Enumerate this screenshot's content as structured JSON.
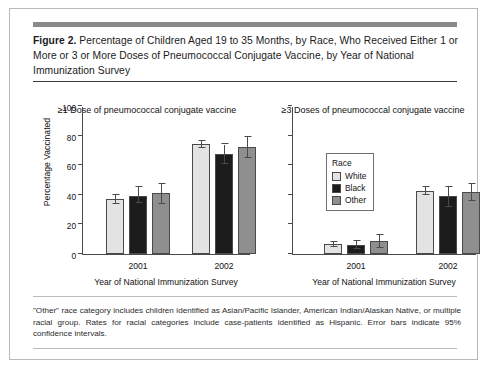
{
  "figure": {
    "label": "Figure 2.",
    "caption": " Percentage of Children Aged 19 to 35 Months, by Race, Who Received Either 1 or More or 3 or More Doses of Pneumococcal Conjugate Vaccine, by Year of National Immunization Survey",
    "footnote": "\"Other\" race category includes children identified as Asian/Pacific Islander, American Indian/Alaskan Native, or multiple racial group. Rates for racial categories include case-patients identified as Hispanic. Error bars indicate 95% confidence intervals."
  },
  "legend": {
    "title": "Race",
    "entries": [
      {
        "label": "White",
        "color": "#e3e3e3"
      },
      {
        "label": "Black",
        "color": "#1c1c1c"
      },
      {
        "label": "Other",
        "color": "#8f8f8f"
      }
    ]
  },
  "axis": {
    "ylabel": "Percentage Vaccinated",
    "xlabel": "Year of National Immunization Survey",
    "yticks": [
      "0",
      "20",
      "40",
      "60",
      "80",
      "100"
    ],
    "xticks": [
      "2001",
      "2002"
    ]
  },
  "chart_data": [
    {
      "type": "bar",
      "title": "≥1 Dose of pneumococcal conjugate vaccine",
      "xlabel": "Year of National Immunization Survey",
      "ylabel": "Percentage Vaccinated",
      "ylim": [
        0,
        100
      ],
      "ytick_values": [
        0,
        20,
        40,
        60,
        80,
        100
      ],
      "grid": false,
      "legend_position": "none",
      "categories": [
        "2001",
        "2002"
      ],
      "series": [
        {
          "name": "White",
          "color": "#e3e3e3",
          "values": [
            37.0,
            74.0
          ],
          "ci_low": [
            34.0,
            71.5
          ],
          "ci_high": [
            40.0,
            76.5
          ]
        },
        {
          "name": "Black",
          "color": "#1c1c1c",
          "values": [
            39.5,
            67.5
          ],
          "ci_low": [
            34.5,
            61.0
          ],
          "ci_high": [
            45.0,
            74.0
          ]
        },
        {
          "name": "Other",
          "color": "#8f8f8f",
          "values": [
            41.0,
            72.0
          ],
          "ci_low": [
            34.0,
            65.0
          ],
          "ci_high": [
            47.5,
            79.0
          ]
        }
      ]
    },
    {
      "type": "bar",
      "title": "≥3 Doses of pneumococcal conjugate vaccine",
      "xlabel": "Year of National Immunization Survey",
      "ylabel": "Percentage Vaccinated",
      "ylim": [
        0,
        100
      ],
      "ytick_values": [
        0,
        20,
        40,
        60,
        80,
        100
      ],
      "grid": false,
      "legend_position": "upper-left-inside",
      "categories": [
        "2001",
        "2002"
      ],
      "series": [
        {
          "name": "White",
          "color": "#e3e3e3",
          "values": [
            6.5,
            42.5
          ],
          "ci_low": [
            5.0,
            40.0
          ],
          "ci_high": [
            8.0,
            45.5
          ]
        },
        {
          "name": "Black",
          "color": "#1c1c1c",
          "values": [
            6.0,
            39.0
          ],
          "ci_low": [
            3.5,
            32.0
          ],
          "ci_high": [
            8.5,
            45.5
          ]
        },
        {
          "name": "Other",
          "color": "#8f8f8f",
          "values": [
            8.5,
            42.0
          ],
          "ci_low": [
            4.0,
            36.0
          ],
          "ci_high": [
            13.0,
            47.5
          ]
        }
      ]
    }
  ]
}
